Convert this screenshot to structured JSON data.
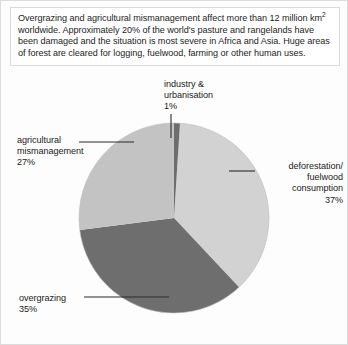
{
  "caption": {
    "text_before_sup": "Overgrazing and agricultural mismanagement affect more than 12 million km",
    "sup": "2",
    "text_after_sup": " worldwide. Approximately 20% of the world's pasture and rangelands have been damaged and the situation is most severe in Africa and Asia. Huge areas of forest are cleared for logging, fuelwood, farming or other human uses."
  },
  "chart_data": {
    "type": "pie",
    "title": "",
    "start_angle_deg": 0,
    "direction": "clockwise",
    "legend": "none",
    "labels": [
      "industry & urbanisation",
      "deforestation/ fuelwood consumption",
      "overgrazing",
      "agricultural mismanagement"
    ],
    "values": [
      1,
      37,
      35,
      27
    ],
    "units": "%",
    "colors": [
      "#6d6d6d",
      "#d2d2d2",
      "#6e6e6e",
      "#c3c3c3"
    ],
    "slices": [
      {
        "name": "industry & urbanisation",
        "value": 1,
        "value_label": "1%",
        "color": "#6d6d6d",
        "label_lines": [
          "industry &",
          "urbanisation",
          "1%"
        ]
      },
      {
        "name": "deforestation/ fuelwood consumption",
        "value": 37,
        "value_label": "37%",
        "color": "#d2d2d2",
        "label_lines": [
          "deforestation/",
          "fuelwood",
          "consumption",
          "37%"
        ]
      },
      {
        "name": "overgrazing",
        "value": 35,
        "value_label": "35%",
        "color": "#6e6e6e",
        "label_lines": [
          "overgrazing",
          "35%"
        ]
      },
      {
        "name": "agricultural mismanagement",
        "value": 27,
        "value_label": "27%",
        "color": "#c3c3c3",
        "label_lines": [
          "agricultural",
          "mismanagement",
          "27%"
        ]
      }
    ]
  },
  "labels": {
    "industry": "industry &\nurbanisation\n1%",
    "deforestation": "deforestation/\nfuelwood\nconsumption\n37%",
    "overgrazing": "overgrazing\n35%",
    "agricultural": "agricultural\nmismanagement\n27%"
  },
  "colors": {
    "slice_industry": "#6d6d6d",
    "slice_deforestation": "#d2d2d2",
    "slice_overgrazing": "#6e6e6e",
    "slice_agricultural": "#c3c3c3",
    "leader_line": "#2a2a2a",
    "frame": "#dcdcdc",
    "text": "#1d1d1d"
  }
}
